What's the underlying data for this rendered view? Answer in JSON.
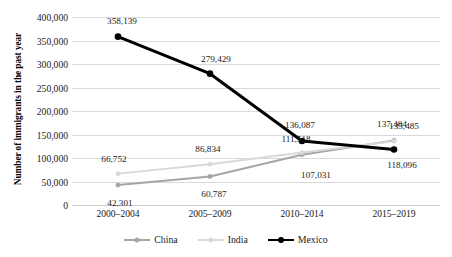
{
  "chart_data": {
    "type": "line",
    "title": "",
    "xlabel": "",
    "ylabel": "Number of immigrants in the past year",
    "categories": [
      "2000–2004",
      "2005–2009",
      "2010–2014",
      "2015–2019"
    ],
    "ylim": [
      0,
      400000
    ],
    "ytick_labels": [
      "0",
      "50,000",
      "100,000",
      "150,000",
      "200,000",
      "250,000",
      "300,000",
      "350,000",
      "400,000"
    ],
    "ytick_values": [
      0,
      50000,
      100000,
      150000,
      200000,
      250000,
      300000,
      350000,
      400000
    ],
    "grid": "horizontal",
    "legend_position": "bottom",
    "series": [
      {
        "name": "China",
        "color": "#a6a6a6",
        "values": [
          42301,
          60787,
          107031,
          137404
        ],
        "labels": [
          "42,301",
          "60,787",
          "107,031",
          "137,404"
        ]
      },
      {
        "name": "India",
        "color": "#d9d9d9",
        "values": [
          66752,
          86834,
          111518,
          135485
        ],
        "labels": [
          "66,752",
          "86,834",
          "111,518",
          "135,485"
        ]
      },
      {
        "name": "Mexico",
        "color": "#000000",
        "values": [
          358139,
          279429,
          136087,
          118096
        ],
        "labels": [
          "358,139",
          "279,429",
          "136,087",
          "118,096"
        ]
      }
    ]
  },
  "axis": {
    "y_title": "Number of immigrants in the past year",
    "y_ticks": {
      "t0": "0",
      "t1": "50,000",
      "t2": "100,000",
      "t3": "150,000",
      "t4": "200,000",
      "t5": "250,000",
      "t6": "300,000",
      "t7": "350,000",
      "t8": "400,000"
    },
    "x_ticks": {
      "c0": "2000–2004",
      "c1": "2005–2009",
      "c2": "2010–2014",
      "c3": "2015–2019"
    }
  },
  "labels": {
    "china": {
      "p0": "42,301",
      "p1": "60,787",
      "p2": "107,031",
      "p3": "137,404"
    },
    "india": {
      "p0": "66,752",
      "p1": "86,834",
      "p2": "111,518",
      "p3": "135,485"
    },
    "mexico": {
      "p0": "358,139",
      "p1": "279,429",
      "p2": "136,087",
      "p3": "118,096"
    }
  },
  "legend": {
    "china": "China",
    "india": "India",
    "mexico": "Mexico"
  },
  "colors": {
    "china": "#a6a6a6",
    "india": "#d9d9d9",
    "mexico": "#000000",
    "gridline": "#d9d9d9"
  }
}
